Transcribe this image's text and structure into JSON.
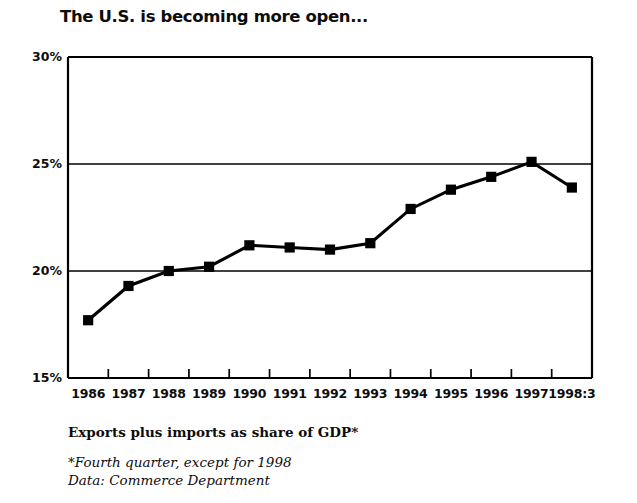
{
  "chart_data": {
    "type": "line",
    "title": "The U.S. is becoming more open...",
    "subtitle": "Exports plus imports as share of GDP*",
    "xlabel": "",
    "ylabel": "",
    "categories": [
      "1986",
      "1987",
      "1988",
      "1989",
      "1990",
      "1991",
      "1992",
      "1993",
      "1994",
      "1995",
      "1996",
      "1997",
      "1998:3"
    ],
    "values": [
      17.7,
      19.3,
      20.0,
      20.2,
      21.2,
      21.1,
      21.0,
      21.3,
      22.9,
      23.8,
      24.4,
      25.1,
      23.9
    ],
    "series": [
      {
        "name": "Exports plus imports as share of GDP",
        "values": [
          17.7,
          19.3,
          20.0,
          20.2,
          21.2,
          21.1,
          21.0,
          21.3,
          22.9,
          23.8,
          24.4,
          25.1,
          23.9
        ]
      }
    ],
    "ylim": [
      15,
      30
    ],
    "ytick_values": [
      30,
      25,
      20,
      15
    ],
    "ytick_labels": [
      "30%",
      "25%",
      "20%",
      "15%"
    ],
    "grid": true,
    "grid_axis": "y",
    "legend": false,
    "legend_position": "none",
    "marker": "square",
    "line_color": "#000000",
    "marker_color": "#000000",
    "background_color": "#ffffff",
    "annotations": [
      "*Fourth quarter, except for 1998",
      "Data: Commerce Department"
    ]
  },
  "captions": {
    "axis_caption": "Exports plus imports as share of GDP*",
    "note_1": "*Fourth quarter, except for 1998",
    "note_2": "Data: Commerce Department"
  },
  "colors": {
    "ink": "#0d0d0d",
    "line": "#000000",
    "grid": "#000000",
    "background": "#ffffff"
  }
}
